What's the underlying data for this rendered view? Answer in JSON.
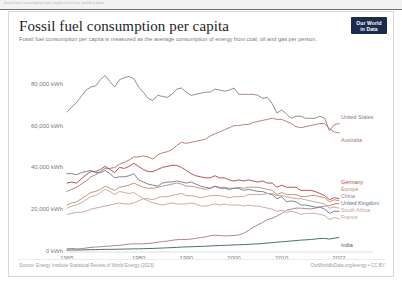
{
  "browser_strip": {
    "ghost_text": "fossil fuel consumption per capita    chart    our world in data"
  },
  "header": {
    "title": "Fossil fuel consumption per capita",
    "subtitle": "Fossil fuel consumption per capita is measured as the average consumption of energy from coal, oil and gas per person.",
    "logo_line1": "Our World",
    "logo_line2": "in Data"
  },
  "footer": {
    "source": "Source: Energy Institute Statistical Review of World Energy (2023)",
    "attribution": "OurWorldInData.org/energy • CC BY"
  },
  "chart_data": {
    "type": "line",
    "title": "Fossil fuel consumption per capita",
    "subtitle": "Fossil fuel consumption per capita is measured as the average consumption of energy from coal, oil and gas per person.",
    "xlabel": "",
    "ylabel": "",
    "grid": false,
    "legend_position": "right-inline",
    "xlim": [
      1965,
      2022
    ],
    "ylim": [
      0,
      90000
    ],
    "yticks": [
      0,
      20000,
      40000,
      60000,
      80000
    ],
    "ytick_labels": [
      "0 kWh",
      "20,000 kWh",
      "40,000 kWh",
      "60,000 kWh",
      "80,000 kWh"
    ],
    "xticks": [
      1965,
      1980,
      1990,
      2000,
      2010,
      2022
    ],
    "xtick_labels": [
      "1965",
      "1980",
      "1990",
      "2000",
      "2010",
      "2022"
    ],
    "x": [
      1965,
      1966,
      1967,
      1968,
      1969,
      1970,
      1971,
      1972,
      1973,
      1974,
      1975,
      1976,
      1977,
      1978,
      1979,
      1980,
      1981,
      1982,
      1983,
      1984,
      1985,
      1986,
      1987,
      1988,
      1989,
      1990,
      1991,
      1992,
      1993,
      1994,
      1995,
      1996,
      1997,
      1998,
      1999,
      2000,
      2001,
      2002,
      2003,
      2004,
      2005,
      2006,
      2007,
      2008,
      2009,
      2010,
      2011,
      2012,
      2013,
      2014,
      2015,
      2016,
      2017,
      2018,
      2019,
      2020,
      2021,
      2022
    ],
    "series": [
      {
        "name": "United States",
        "color": "#9c8579",
        "label_color": "#8c7a6e",
        "values": [
          67000,
          69500,
          71500,
          74500,
          77500,
          79000,
          79500,
          82500,
          84500,
          81500,
          79000,
          82500,
          83500,
          84000,
          83000,
          79000,
          76500,
          73500,
          72500,
          75000,
          74500,
          74000,
          75500,
          78000,
          78500,
          76500,
          75000,
          75500,
          76000,
          76500,
          76500,
          78000,
          77500,
          77000,
          77500,
          78500,
          75500,
          75500,
          75500,
          75500,
          75000,
          73500,
          74000,
          71000,
          66500,
          68000,
          66000,
          64000,
          65000,
          65000,
          64000,
          64000,
          64000,
          65000,
          64000,
          58000,
          61000,
          61500
        ]
      },
      {
        "name": "Australia",
        "color": "#b07d70",
        "label_color": "#a8766a",
        "values": [
          29000,
          30000,
          31000,
          32500,
          34000,
          36000,
          37000,
          38500,
          40000,
          40000,
          40500,
          42000,
          43000,
          44000,
          45500,
          45500,
          46000,
          45500,
          44500,
          46500,
          47500,
          48000,
          49000,
          51000,
          52500,
          52000,
          52500,
          53000,
          53500,
          54000,
          55500,
          56500,
          57500,
          58500,
          59500,
          60500,
          60500,
          61000,
          61000,
          62000,
          62500,
          63000,
          63500,
          64000,
          63500,
          63500,
          62500,
          61500,
          60000,
          59500,
          60000,
          60500,
          61000,
          61500,
          61500,
          59000,
          57500,
          57000
        ]
      },
      {
        "name": "Germany",
        "color": "#b5494d",
        "label_color": "#b5494d",
        "values": [
          33000,
          33500,
          33000,
          35000,
          37000,
          38500,
          38500,
          39500,
          41000,
          39500,
          38000,
          40500,
          40000,
          41000,
          42500,
          41000,
          39500,
          38500,
          38500,
          39500,
          40500,
          41000,
          41500,
          41500,
          40500,
          39000,
          37500,
          36500,
          36000,
          35500,
          35500,
          36500,
          35500,
          35500,
          34500,
          34000,
          34500,
          34000,
          34500,
          34000,
          33500,
          34000,
          33000,
          33000,
          31000,
          32000,
          31000,
          31000,
          31000,
          29500,
          29500,
          29500,
          29000,
          28000,
          27000,
          25000,
          26000,
          25500
        ]
      },
      {
        "name": "Europe",
        "color": "#c2906f",
        "label_color": "#c08c6c",
        "values": [
          22500,
          23500,
          24000,
          25500,
          27000,
          28500,
          29000,
          30000,
          31500,
          30500,
          29500,
          31000,
          31500,
          32000,
          33000,
          32000,
          31000,
          30500,
          30500,
          31000,
          31500,
          32000,
          32500,
          33000,
          32500,
          31500,
          31500,
          31000,
          30500,
          30000,
          30500,
          31500,
          31000,
          31000,
          30500,
          30500,
          31000,
          30500,
          31000,
          31000,
          31000,
          30500,
          30000,
          29500,
          27500,
          28500,
          27500,
          27500,
          27500,
          26500,
          26500,
          27000,
          27000,
          26500,
          26000,
          24000,
          25000,
          24500
        ]
      },
      {
        "name": "China",
        "color": "#a87f84",
        "label_color": "#a87f84",
        "values": [
          1500,
          1700,
          1500,
          1600,
          1900,
          2200,
          2400,
          2500,
          2700,
          2800,
          3100,
          3200,
          3500,
          3800,
          3900,
          3900,
          3900,
          4100,
          4300,
          4700,
          5000,
          5200,
          5600,
          5900,
          6000,
          6000,
          6200,
          6500,
          6900,
          7200,
          7800,
          8000,
          7900,
          7700,
          7800,
          7900,
          8200,
          8900,
          10200,
          11800,
          13000,
          14200,
          15500,
          16200,
          17200,
          18500,
          20000,
          20500,
          21000,
          21000,
          20800,
          20600,
          21000,
          21500,
          22000,
          22200,
          23000,
          23200
        ]
      },
      {
        "name": "United Kingdom",
        "color": "#6b7f97",
        "label_color": "#5d7188",
        "values": [
          37500,
          37500,
          37000,
          38000,
          38500,
          39000,
          38000,
          38000,
          39000,
          37500,
          35500,
          36000,
          36000,
          36500,
          37500,
          34500,
          33500,
          32500,
          32000,
          31500,
          33000,
          33500,
          33500,
          34000,
          33500,
          33000,
          33500,
          32500,
          31500,
          31000,
          30500,
          31500,
          30500,
          30500,
          30000,
          30500,
          30500,
          29500,
          30000,
          29500,
          29000,
          29000,
          28000,
          27500,
          25500,
          26500,
          24000,
          24500,
          24000,
          22500,
          22500,
          22000,
          21500,
          21500,
          20500,
          18500,
          19500,
          19500
        ]
      },
      {
        "name": "South Africa",
        "color": "#c1a49b",
        "label_color": "#bda197",
        "values": [
          18000,
          18500,
          19000,
          19000,
          19500,
          20500,
          21000,
          21500,
          22000,
          22500,
          23000,
          23500,
          23000,
          23000,
          23500,
          24500,
          25500,
          25500,
          25000,
          26000,
          26500,
          26500,
          27000,
          27500,
          28000,
          27000,
          27000,
          26500,
          26000,
          26500,
          27000,
          27000,
          27000,
          26500,
          26000,
          26500,
          26500,
          26500,
          27500,
          27500,
          27500,
          27500,
          28000,
          28000,
          27000,
          27000,
          26500,
          26000,
          25500,
          25500,
          25000,
          24500,
          24000,
          23500,
          23000,
          21000,
          21500,
          21000
        ]
      },
      {
        "name": "France",
        "color": "#c8a8a0",
        "label_color": "#c4a49c",
        "values": [
          21000,
          22000,
          22500,
          23500,
          25000,
          26500,
          27000,
          28500,
          30000,
          29000,
          27500,
          29000,
          28500,
          28000,
          28500,
          27000,
          25500,
          24500,
          23500,
          23000,
          22500,
          23000,
          23500,
          23000,
          23000,
          23000,
          23500,
          23000,
          22000,
          22000,
          22500,
          23000,
          22500,
          23000,
          22500,
          22500,
          22500,
          22000,
          22500,
          22000,
          22000,
          21500,
          21000,
          20500,
          19500,
          20000,
          19000,
          19500,
          19000,
          18000,
          18500,
          18500,
          18500,
          18000,
          17500,
          15500,
          16500,
          16000
        ]
      },
      {
        "name": "India",
        "color": "#3f6b52",
        "label_color": "#3f6b52",
        "values": [
          900,
          950,
          950,
          1000,
          1050,
          1100,
          1150,
          1200,
          1250,
          1250,
          1300,
          1350,
          1400,
          1450,
          1500,
          1500,
          1600,
          1650,
          1700,
          1800,
          1900,
          2000,
          2100,
          2200,
          2350,
          2450,
          2500,
          2600,
          2700,
          2750,
          2900,
          3000,
          3100,
          3200,
          3300,
          3400,
          3450,
          3550,
          3650,
          3800,
          3900,
          4100,
          4300,
          4450,
          4700,
          4900,
          5050,
          5300,
          5450,
          5700,
          5800,
          6000,
          6200,
          6450,
          6500,
          6200,
          6600,
          6900
        ]
      }
    ],
    "inline_labels": [
      {
        "name": "United States",
        "x": 332,
        "y": 105
      },
      {
        "name": "Australia",
        "x": 332,
        "y": 128
      },
      {
        "name": "Germany",
        "x": 332,
        "y": 170
      },
      {
        "name": "Europe",
        "x": 332,
        "y": 177
      },
      {
        "name": "China",
        "x": 332,
        "y": 184
      },
      {
        "name": "United Kingdom",
        "x": 332,
        "y": 191
      },
      {
        "name": "South Africa",
        "x": 332,
        "y": 198
      },
      {
        "name": "France",
        "x": 332,
        "y": 205
      },
      {
        "name": "India",
        "x": 332,
        "y": 233
      }
    ]
  }
}
